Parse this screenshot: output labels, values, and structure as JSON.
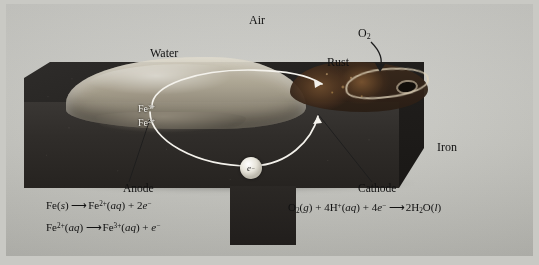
{
  "figure": {
    "background_color": "#c9c9c4"
  },
  "labels": {
    "air": "Air",
    "water": "Water",
    "rust": "Rust",
    "oxygen": "O2",
    "oxygen_formula": {
      "element": "O",
      "subscript": "2"
    },
    "iron": "Iron",
    "anode": "Anode",
    "cathode": "Cathode",
    "electron": "e",
    "electron_charge": "−",
    "ion_fe3_base": "Fe",
    "ion_fe3_sup": "3+",
    "ion_fe2_base": "Fe",
    "ion_fe2_sup": "2+"
  },
  "equations": {
    "anode": [
      {
        "id": "anode-oxidation-1",
        "left": "Fe(s)",
        "arrow": "⟶",
        "right": "Fe2+(aq) + 2e−",
        "left_parts": {
          "formula": "Fe",
          "state": "s"
        },
        "right_parts": {
          "ion": "Fe",
          "ion_charge": "2+",
          "state": "aq",
          "coefficient": "2",
          "electron": "e",
          "electron_charge": "−"
        }
      },
      {
        "id": "anode-oxidation-2",
        "left": "Fe2+(aq)",
        "arrow": "⟶",
        "right": "Fe3+(aq) + e−",
        "left_parts": {
          "formula": "Fe",
          "charge": "2+",
          "state": "aq"
        },
        "right_parts": {
          "ion": "Fe",
          "ion_charge": "3+",
          "state": "aq",
          "electron": "e",
          "electron_charge": "−"
        }
      }
    ],
    "cathode": [
      {
        "id": "cathode-reduction-1",
        "left": "O2(g) + 4H+(aq) + 4e−",
        "arrow": "⟶",
        "right": "2H2O(l)",
        "left_parts": {
          "oxygen": "O",
          "oxygen_sub": "2",
          "oxygen_state": "g",
          "h_coeff": "4",
          "hydrogen": "H",
          "h_charge": "+",
          "h_state": "aq",
          "e_coeff": "4",
          "electron": "e",
          "electron_charge": "−"
        },
        "right_parts": {
          "coefficient": "2",
          "hydrogen": "H",
          "h_sub": "2",
          "oxygen": "O",
          "state": "l"
        }
      }
    ]
  },
  "colors": {
    "plate": "#c7c7c1",
    "iron_top": "#26242 2",
    "iron_front": "#302d2a",
    "rust": "#3b2a1c",
    "water": "#bab29e",
    "arc_white": "#f4f2ec",
    "leader_line": "#1d1d1d"
  },
  "annotations": {
    "electron_flow_description": "White elliptical arc showing electron flow from anode through iron to cathode",
    "o2_arrow_description": "Curved arrow from O2 label down to rust surface"
  }
}
